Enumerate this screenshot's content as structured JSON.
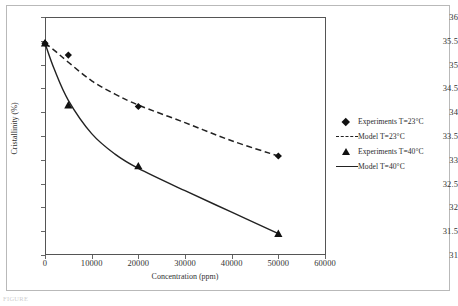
{
  "chart_data": {
    "type": "scatter",
    "title": "",
    "xlabel": "Concentration (ppm)",
    "ylabel": "Cristallinity (%)",
    "xlim": [
      0,
      60000
    ],
    "ylim": [
      31,
      36
    ],
    "xticks": [
      "0",
      "10000",
      "20000",
      "30000",
      "40000",
      "50000",
      "60000"
    ],
    "xtick_values": [
      0,
      10000,
      20000,
      30000,
      40000,
      50000,
      60000
    ],
    "yticks": [
      "31",
      "31.5",
      "32",
      "32.5",
      "33",
      "33.5",
      "34",
      "34.5",
      "35",
      "35.5",
      "36"
    ],
    "ytick_values": [
      31,
      31.5,
      32,
      32.5,
      33,
      33.5,
      34,
      34.5,
      35,
      35.5,
      36
    ],
    "grid": false,
    "legend_position": "right",
    "series": [
      {
        "name": "Experiments T=23°C",
        "kind": "scatter",
        "marker": "diamond",
        "color": "#111111",
        "x": [
          0,
          5000,
          20000,
          50000
        ],
        "y": [
          35.45,
          35.2,
          34.12,
          33.08
        ]
      },
      {
        "name": "Model T=23°C",
        "kind": "line",
        "style": "dashed",
        "color": "#222222",
        "x": [
          0,
          2000,
          5000,
          10000,
          15000,
          20000,
          30000,
          40000,
          50000
        ],
        "y": [
          35.45,
          35.3,
          35.05,
          34.66,
          34.38,
          34.15,
          33.78,
          33.4,
          33.08
        ]
      },
      {
        "name": "Experiments T=40°C",
        "kind": "scatter",
        "marker": "triangle",
        "color": "#111111",
        "x": [
          0,
          5000,
          20000,
          50000
        ],
        "y": [
          35.45,
          34.15,
          32.87,
          31.45
        ]
      },
      {
        "name": "Model T=40°C",
        "kind": "line",
        "style": "solid",
        "color": "#222222",
        "x": [
          0,
          2000,
          5000,
          10000,
          15000,
          20000,
          30000,
          40000,
          50000
        ],
        "y": [
          35.45,
          34.9,
          34.25,
          33.55,
          33.12,
          32.82,
          32.35,
          31.9,
          31.45
        ]
      }
    ]
  },
  "legend": {
    "items": [
      {
        "label": "Experiments T=23°C",
        "key": "diamond"
      },
      {
        "label": "Model T=23°C",
        "key": "dashed"
      },
      {
        "label": "Experiments T=40°C",
        "key": "triangle"
      },
      {
        "label": "Model T=40°C",
        "key": "solid"
      }
    ]
  },
  "caption": "FIGURE"
}
